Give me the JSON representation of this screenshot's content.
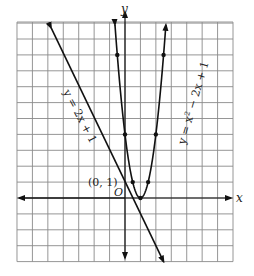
{
  "chart_data": {
    "type": "line",
    "title": "",
    "xlabel": "x",
    "ylabel": "y",
    "xlim": [
      -7,
      7
    ],
    "ylim": [
      -4,
      11
    ],
    "grid": true,
    "series": [
      {
        "name": "y = 2x + 1",
        "type": "line",
        "points": [
          [
            -4,
            -7
          ],
          [
            -3,
            -5
          ],
          [
            0,
            1
          ],
          [
            3,
            7
          ]
        ],
        "marked_points": [
          [
            0,
            1
          ]
        ]
      },
      {
        "name": "y = x^2 - 2x + 1",
        "type": "curve",
        "points": [
          [
            -2,
            9
          ],
          [
            -1,
            4
          ],
          [
            0,
            1
          ],
          [
            1,
            0
          ],
          [
            2,
            1
          ],
          [
            3,
            4
          ],
          [
            4,
            9
          ]
        ],
        "marked_points": [
          [
            -2,
            9
          ],
          [
            -1,
            4
          ],
          [
            0,
            1
          ],
          [
            1,
            0
          ],
          [
            2,
            1
          ],
          [
            3,
            4
          ],
          [
            4,
            9
          ]
        ]
      }
    ],
    "annotations": [
      "(0, 1)",
      "O"
    ]
  },
  "labels": {
    "x_axis": "x",
    "y_axis": "y",
    "origin": "O",
    "point": "(0, 1)",
    "line_eq": "y = 2x + 1",
    "parabola_eq_prefix": "y = x",
    "parabola_eq_exp": "2",
    "parabola_eq_suffix": " − 2x + 1"
  }
}
